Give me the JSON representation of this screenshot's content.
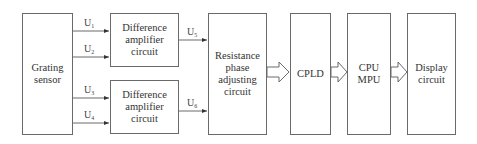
{
  "diagram": {
    "type": "block-diagram",
    "blocks": [
      {
        "id": "grating",
        "label": "Grating\nsensor"
      },
      {
        "id": "diffamp1",
        "label": "Difference\namplifier\ncircuit"
      },
      {
        "id": "diffamp2",
        "label": "Difference\namplifier\ncircuit"
      },
      {
        "id": "resist",
        "label": "Resistance\nphase\nadjusting\ncircuit"
      },
      {
        "id": "cpld",
        "label": "CPLD"
      },
      {
        "id": "cpu",
        "label": "CPU\nMPU"
      },
      {
        "id": "display",
        "label": "Display\ncircuit"
      }
    ],
    "signals": [
      {
        "base": "U",
        "sub": "1"
      },
      {
        "base": "U",
        "sub": "2"
      },
      {
        "base": "U",
        "sub": "3"
      },
      {
        "base": "U",
        "sub": "4"
      },
      {
        "base": "U",
        "sub": "5"
      },
      {
        "base": "U",
        "sub": "6"
      }
    ],
    "edges": [
      {
        "from": "grating",
        "to": "diffamp1",
        "label": "U1"
      },
      {
        "from": "grating",
        "to": "diffamp1",
        "label": "U2"
      },
      {
        "from": "grating",
        "to": "diffamp2",
        "label": "U3"
      },
      {
        "from": "grating",
        "to": "diffamp2",
        "label": "U4"
      },
      {
        "from": "diffamp1",
        "to": "resist",
        "label": "U5"
      },
      {
        "from": "diffamp2",
        "to": "resist",
        "label": "U6"
      },
      {
        "from": "resist",
        "to": "cpld",
        "style": "hollow-arrow"
      },
      {
        "from": "cpld",
        "to": "cpu",
        "style": "hollow-arrow"
      },
      {
        "from": "cpu",
        "to": "display",
        "style": "hollow-arrow"
      }
    ],
    "colors": {
      "line": "#6a6a6a",
      "text": "#333333",
      "background": "#ffffff"
    }
  }
}
